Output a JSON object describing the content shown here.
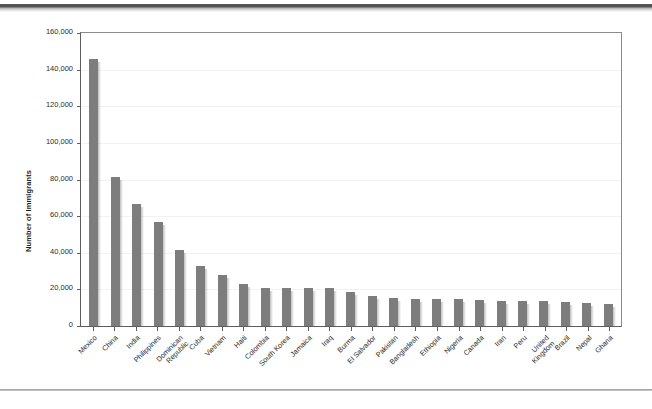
{
  "page": {
    "top_rule": "decorative-top-rule",
    "bottom_rule": "decorative-bottom-rule"
  },
  "chart_data": {
    "type": "bar",
    "title": "",
    "xlabel": "",
    "ylabel": "Number of Immigrants",
    "ylim": [
      0,
      160000
    ],
    "ytick_labels": [
      "160,000",
      "140,000",
      "120,000",
      "100,000",
      "80,000",
      "60,000",
      "40,000",
      "20,000",
      "0"
    ],
    "ytick_values": [
      160000,
      140000,
      120000,
      100000,
      80000,
      60000,
      40000,
      20000,
      0
    ],
    "grid": true,
    "legend": false,
    "bar_color": "#7d7d7d",
    "categories": [
      "Mexico",
      "China",
      "India",
      "Philippines",
      "Dominican Republic",
      "Cuba",
      "Vietnam",
      "Haiti",
      "Colombia",
      "South Korea",
      "Jamaica",
      "Iraq",
      "Burma",
      "El Salvador",
      "Pakistan",
      "Bangladesh",
      "Ethiopia",
      "Nigeria",
      "Canada",
      "Iran",
      "Peru",
      "United Kingdom",
      "Brazil",
      "Nepal",
      "Ghana"
    ],
    "category_lines": [
      [
        "Mexico"
      ],
      [
        "China"
      ],
      [
        "India"
      ],
      [
        "Philippines"
      ],
      [
        "Dominican",
        "Republic"
      ],
      [
        "Cuba"
      ],
      [
        "Vietnam"
      ],
      [
        "Haiti"
      ],
      [
        "Colombia"
      ],
      [
        "South Korea"
      ],
      [
        "Jamaica"
      ],
      [
        "Iraq"
      ],
      [
        "Burma"
      ],
      [
        "El Salvador"
      ],
      [
        "Pakistan"
      ],
      [
        "Bangladesh"
      ],
      [
        "Ethiopia"
      ],
      [
        "Nigeria"
      ],
      [
        "Canada"
      ],
      [
        "Iran"
      ],
      [
        "Peru"
      ],
      [
        "United",
        "Kingdom"
      ],
      [
        "Brazil"
      ],
      [
        "Nepal"
      ],
      [
        "Ghana"
      ]
    ],
    "values": [
      146000,
      81500,
      66500,
      57000,
      41500,
      33000,
      28000,
      23000,
      21000,
      21000,
      21000,
      21000,
      18500,
      16500,
      15500,
      15000,
      15000,
      14500,
      14000,
      13800,
      13800,
      13800,
      13000,
      12800,
      12000
    ]
  }
}
